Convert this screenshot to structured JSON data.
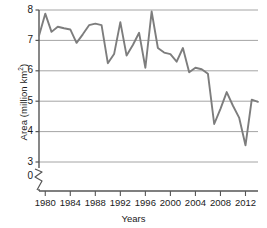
{
  "chart_data": {
    "type": "line",
    "title": "",
    "xlabel": "Years",
    "ylabel": "Area (million km",
    "ylabel_sup": "2",
    "ylabel_suffix": ")",
    "ytick_labels": [
      "8",
      "7",
      "6",
      "5",
      "4",
      "3",
      "0"
    ],
    "ytick_values": [
      8,
      7,
      6,
      5,
      4,
      3,
      0
    ],
    "xtick_labels": [
      "1980",
      "1984",
      "1988",
      "1992",
      "1996",
      "2000",
      "2004",
      "2008",
      "2012"
    ],
    "xtick_values": [
      1980,
      1984,
      1988,
      1992,
      1996,
      2000,
      2004,
      2008,
      2012
    ],
    "xlim": [
      1979,
      2014
    ],
    "ylim": [
      3,
      8
    ],
    "axis_break": true,
    "grid": "horizontal",
    "legend": "none",
    "line_color": "#7d7d7d",
    "axis_color": "#555555",
    "grid_color": "#9a9a9a",
    "x": [
      1979,
      1980,
      1981,
      1982,
      1983,
      1984,
      1985,
      1986,
      1987,
      1988,
      1989,
      1990,
      1991,
      1992,
      1993,
      1994,
      1995,
      1996,
      1997,
      1998,
      1999,
      2000,
      2001,
      2002,
      2003,
      2004,
      2005,
      2006,
      2007,
      2008,
      2009,
      2010,
      2011,
      2012,
      2013,
      2014
    ],
    "values": [
      7.15,
      7.88,
      7.28,
      7.45,
      7.4,
      7.36,
      6.92,
      7.2,
      7.5,
      7.55,
      7.5,
      6.25,
      6.55,
      7.6,
      6.5,
      6.85,
      7.25,
      6.1,
      7.95,
      6.75,
      6.6,
      6.55,
      6.3,
      6.75,
      5.95,
      6.1,
      6.05,
      5.9,
      4.25,
      4.75,
      5.3,
      4.85,
      4.45,
      3.55,
      5.05,
      4.98
    ]
  }
}
